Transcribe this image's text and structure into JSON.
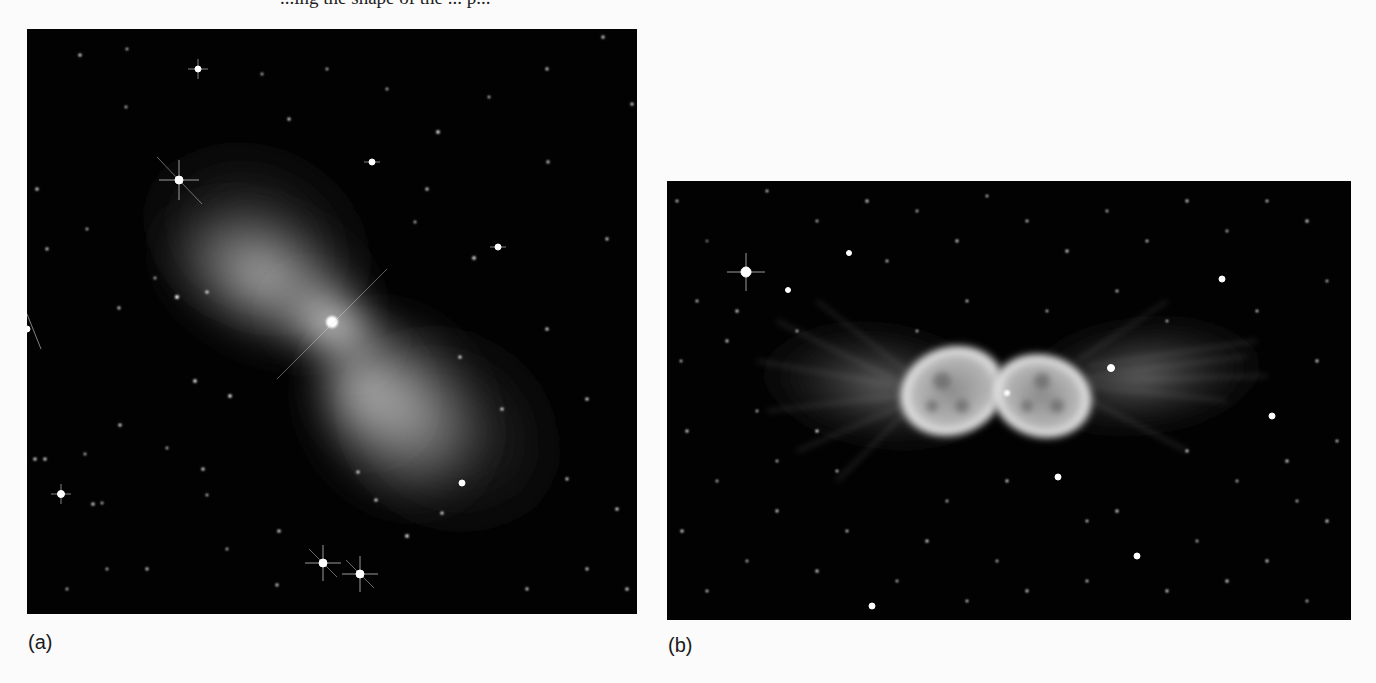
{
  "page": {
    "top_text_fragment": "...ing the shape of the ... p...",
    "figure": {
      "panels": [
        {
          "id": "a",
          "label": "(a)",
          "description": "Bipolar hourglass/bow-tie shaped reflection nebula with bright central point, diffuse grey lobes extending upper-left and lower-right, scattered field stars with diffraction spikes on black background",
          "colors": {
            "background": "#020202",
            "nebula": "#e8e8e8",
            "stars": "#ffffff"
          }
        },
        {
          "id": "b",
          "label": "(b)",
          "description": "Bipolar planetary nebula with two bright bubble-like lobes meeting at a central star, filamentary streamers extending left and right, dense star field on black background",
          "colors": {
            "background": "#020202",
            "nebula": "#dcdcdc",
            "stars": "#ffffff"
          }
        }
      ]
    }
  }
}
